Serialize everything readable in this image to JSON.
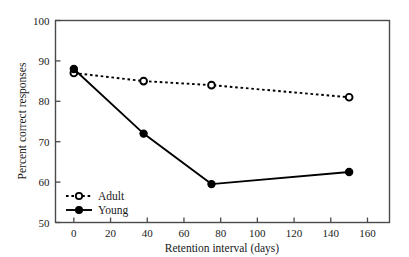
{
  "chart_data": {
    "type": "line",
    "title": "",
    "xlabel": "Retention interval (days)",
    "ylabel": "Percent correct responses",
    "xlim": [
      -10,
      172
    ],
    "ylim": [
      50,
      100
    ],
    "xticks": [
      0,
      20,
      40,
      60,
      80,
      100,
      120,
      140,
      160
    ],
    "yticks": [
      50,
      60,
      70,
      80,
      90,
      100
    ],
    "xtick_labels": [
      "0",
      "20",
      "40",
      "60",
      "80",
      "100",
      "120",
      "140",
      "160"
    ],
    "ytick_labels": [
      "50",
      "60",
      "70",
      "80",
      "90",
      "100"
    ],
    "grid": false,
    "legend_position": "lower left",
    "series": [
      {
        "name": "Adult",
        "style": "dashed",
        "marker": "open-circle",
        "color": "#000000",
        "x": [
          0,
          38,
          75,
          150
        ],
        "values": [
          87.0,
          85.0,
          84.0,
          81.0
        ]
      },
      {
        "name": "Young",
        "style": "solid",
        "marker": "filled-circle",
        "color": "#000000",
        "x": [
          0,
          38,
          75,
          150
        ],
        "values": [
          88.0,
          72.0,
          59.5,
          62.5
        ]
      }
    ]
  },
  "legend": {
    "entries": [
      {
        "label": "Adult"
      },
      {
        "label": "Young"
      }
    ]
  },
  "axes": {
    "x_title": "Retention interval (days)",
    "y_title": "Percent correct responses"
  }
}
